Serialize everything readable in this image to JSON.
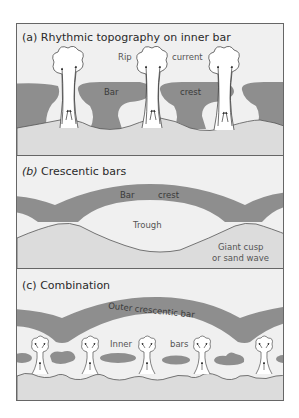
{
  "figure": {
    "colors": {
      "background": "#ffffff",
      "water": "#f0f0f0",
      "beach": "#dcdcdc",
      "bar": "#8e8e8e",
      "outline": "#555555",
      "frame": "#666666"
    },
    "panels": [
      {
        "id": "a",
        "title_prefix": "(a)",
        "title": "Rhythmic topography on inner bar",
        "labels": {
          "rip": "Rip",
          "current": "current",
          "bar": "Bar",
          "crest": "crest"
        }
      },
      {
        "id": "b",
        "title_prefix": "(b)",
        "title": "Crescentic bars",
        "labels": {
          "bar": "Bar",
          "crest": "crest",
          "trough": "Trough",
          "giant_cusp_line1": "Giant cusp",
          "giant_cusp_line2": "or sand wave"
        }
      },
      {
        "id": "c",
        "title_prefix": "(c)",
        "title": "Combination",
        "labels": {
          "outer_bar": "Outer crescentic bar",
          "inner": "Inner",
          "bars": "bars"
        }
      }
    ]
  }
}
